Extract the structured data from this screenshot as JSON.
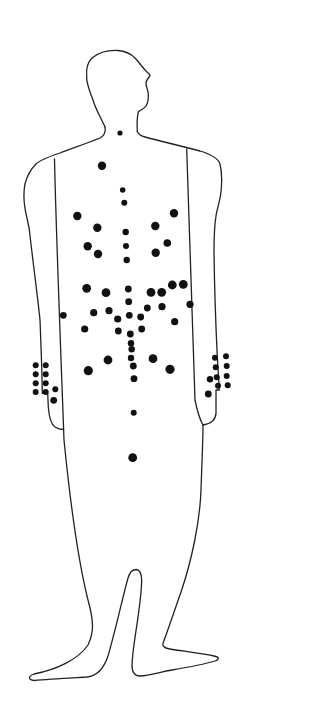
{
  "diagram": {
    "line_color": "#222222",
    "dot_color": "#111111",
    "background": "#ffffff",
    "dots": [
      {
        "x": 120,
        "y": 133,
        "r": 2.6
      },
      {
        "x": 102,
        "y": 165.7,
        "r": 4.2
      },
      {
        "x": 122.7,
        "y": 190,
        "r": 2.8
      },
      {
        "x": 124.3,
        "y": 202.7,
        "r": 3
      },
      {
        "x": 77.3,
        "y": 216,
        "r": 4.2
      },
      {
        "x": 174,
        "y": 213.3,
        "r": 4.2
      },
      {
        "x": 97.3,
        "y": 227.7,
        "r": 4.2
      },
      {
        "x": 155.3,
        "y": 226,
        "r": 4.2
      },
      {
        "x": 125.7,
        "y": 232,
        "r": 3.2
      },
      {
        "x": 87.7,
        "y": 246.3,
        "r": 4.2
      },
      {
        "x": 167.3,
        "y": 243,
        "r": 3.8
      },
      {
        "x": 126,
        "y": 246,
        "r": 3
      },
      {
        "x": 98,
        "y": 254,
        "r": 4.2
      },
      {
        "x": 155.7,
        "y": 252.7,
        "r": 4.2
      },
      {
        "x": 126.7,
        "y": 260,
        "r": 3.2
      },
      {
        "x": 86.7,
        "y": 288.3,
        "r": 4.4
      },
      {
        "x": 106,
        "y": 292.7,
        "r": 4.4
      },
      {
        "x": 128.3,
        "y": 289,
        "r": 3.4
      },
      {
        "x": 151,
        "y": 292.3,
        "r": 4.4
      },
      {
        "x": 161.7,
        "y": 292.3,
        "r": 4.4
      },
      {
        "x": 172.3,
        "y": 285,
        "r": 4.4
      },
      {
        "x": 183.3,
        "y": 284.3,
        "r": 4.4
      },
      {
        "x": 63.3,
        "y": 315.3,
        "r": 3.4
      },
      {
        "x": 93.7,
        "y": 312.7,
        "r": 3.6
      },
      {
        "x": 109,
        "y": 310.7,
        "r": 3.6
      },
      {
        "x": 128.7,
        "y": 301.7,
        "r": 3.4
      },
      {
        "x": 147.3,
        "y": 308,
        "r": 3.4
      },
      {
        "x": 162,
        "y": 306.7,
        "r": 3.6
      },
      {
        "x": 190,
        "y": 304.3,
        "r": 3.6
      },
      {
        "x": 117.7,
        "y": 319,
        "r": 3.6
      },
      {
        "x": 129.3,
        "y": 315.3,
        "r": 3.4
      },
      {
        "x": 140.7,
        "y": 317,
        "r": 3.4
      },
      {
        "x": 84.7,
        "y": 329,
        "r": 3.6
      },
      {
        "x": 118.3,
        "y": 331,
        "r": 3.4
      },
      {
        "x": 130.3,
        "y": 334,
        "r": 3.4
      },
      {
        "x": 141.7,
        "y": 329,
        "r": 3.4
      },
      {
        "x": 174.7,
        "y": 321.7,
        "r": 3.6
      },
      {
        "x": 131,
        "y": 343.3,
        "r": 3.2
      },
      {
        "x": 131.7,
        "y": 349.3,
        "r": 3.2
      },
      {
        "x": 131,
        "y": 358,
        "r": 3.2
      },
      {
        "x": 108,
        "y": 360,
        "r": 4.4
      },
      {
        "x": 153,
        "y": 358.7,
        "r": 4.4
      },
      {
        "x": 133.3,
        "y": 366,
        "r": 3.4
      },
      {
        "x": 88.3,
        "y": 370.7,
        "r": 4.6
      },
      {
        "x": 170,
        "y": 369.3,
        "r": 4.6
      },
      {
        "x": 134,
        "y": 378.7,
        "r": 3.4
      },
      {
        "x": 35.7,
        "y": 365.3,
        "r": 3
      },
      {
        "x": 45.7,
        "y": 365.3,
        "r": 3
      },
      {
        "x": 35.7,
        "y": 374.3,
        "r": 3
      },
      {
        "x": 45.7,
        "y": 374.3,
        "r": 3
      },
      {
        "x": 35.7,
        "y": 383.3,
        "r": 3
      },
      {
        "x": 45.7,
        "y": 383.3,
        "r": 3
      },
      {
        "x": 35.7,
        "y": 392,
        "r": 3
      },
      {
        "x": 45.7,
        "y": 392,
        "r": 3
      },
      {
        "x": 55.3,
        "y": 389.3,
        "r": 3
      },
      {
        "x": 53.7,
        "y": 400.3,
        "r": 3.4
      },
      {
        "x": 215,
        "y": 357.7,
        "r": 3
      },
      {
        "x": 226,
        "y": 356.3,
        "r": 3
      },
      {
        "x": 215.7,
        "y": 367.3,
        "r": 3
      },
      {
        "x": 226.7,
        "y": 366,
        "r": 3
      },
      {
        "x": 210,
        "y": 379.3,
        "r": 3.2
      },
      {
        "x": 216.7,
        "y": 377.3,
        "r": 3
      },
      {
        "x": 226.7,
        "y": 376,
        "r": 3
      },
      {
        "x": 218,
        "y": 385.7,
        "r": 3
      },
      {
        "x": 227.7,
        "y": 385.3,
        "r": 3
      },
      {
        "x": 208.3,
        "y": 394,
        "r": 3.4
      },
      {
        "x": 133.7,
        "y": 412.7,
        "r": 3
      },
      {
        "x": 132.7,
        "y": 457.7,
        "r": 4.4
      }
    ]
  }
}
